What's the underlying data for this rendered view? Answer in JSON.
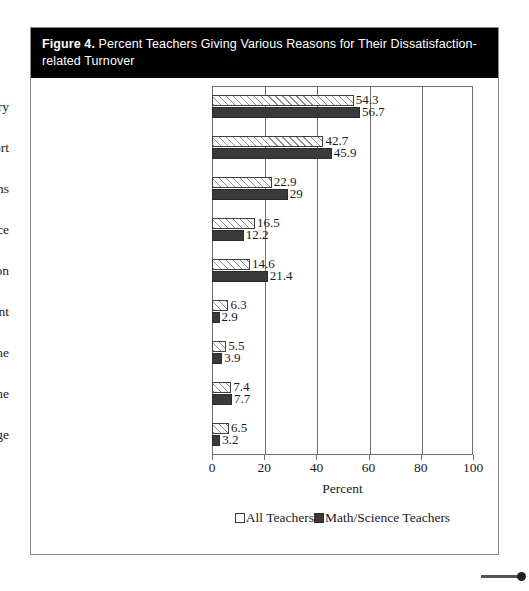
{
  "figure": {
    "number_label": "Figure 4.",
    "title": "Percent Teachers Giving Various Reasons for Their Dissatisfaction-related Turnover"
  },
  "chart_data": {
    "type": "bar",
    "orientation": "horizontal",
    "title": "Percent Teachers Giving Various Reasons for Their Dissatisfaction-related Turnover",
    "xlabel": "Percent",
    "ylabel": "",
    "xlim": [
      0,
      100
    ],
    "xticks": [
      0,
      20,
      40,
      60,
      80,
      100
    ],
    "xticklabels": [
      "0",
      "20",
      "40",
      "60",
      "80",
      "100"
    ],
    "grid": true,
    "legend_position": "bottom",
    "categories": [
      "Poor Salary",
      "Poor Administrative Support",
      "Student Discipline Problems",
      "Lack of Faculty Influence",
      "Poor Student Motivation",
      "Poor Opportunity for Advancement",
      "Inadequate Time",
      "Intrusions on Teaching Time",
      "Class Sizes Too Large"
    ],
    "series": [
      {
        "name": "All Teachers",
        "color": "#ffffff",
        "pattern": "diagonal-hatch",
        "values": [
          54.3,
          42.7,
          22.9,
          16.5,
          14.6,
          6.3,
          5.5,
          7.4,
          6.5
        ],
        "value_labels": [
          "54.3",
          "42.7",
          "22.9",
          "16.5",
          "14.6",
          "6.3",
          "5.5",
          "7.4",
          "6.5"
        ]
      },
      {
        "name": "Math/Science Teachers",
        "color": "#3a3a3a",
        "pattern": "solid",
        "values": [
          56.7,
          45.9,
          29,
          12.2,
          21.4,
          2.9,
          3.9,
          7.7,
          3.2
        ],
        "value_labels": [
          "56.7",
          "45.9",
          "29",
          "12.2",
          "21.4",
          "2.9",
          "3.9",
          "7.7",
          "3.2"
        ]
      }
    ]
  }
}
